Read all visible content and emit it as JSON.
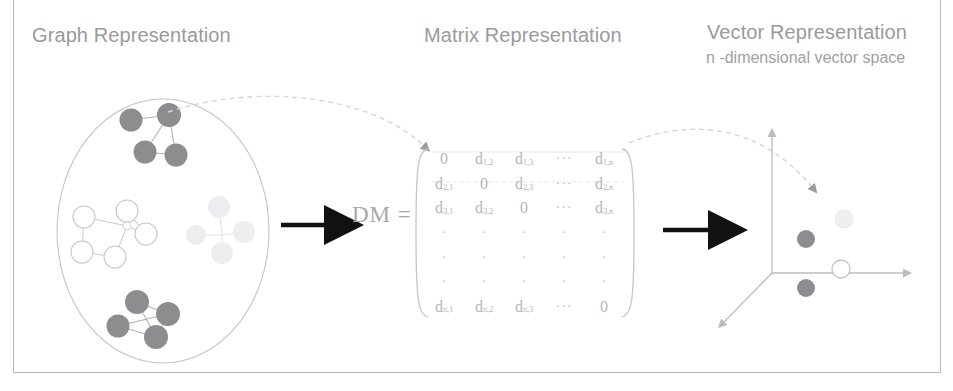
{
  "figure": {
    "alt_title": "Graph to Matrix to Vector Representation pipeline",
    "background_color": "#ffffff",
    "frame_color": "#b9b9bb"
  },
  "panels": {
    "graph": {
      "title": "Graph Representation",
      "boundary_shape": "ellipse",
      "clusters": [
        {
          "name": "cluster-top-dark",
          "style": "dark-filled",
          "fill_color": "#8d8d8f",
          "node_count": 4,
          "edge_count": 4
        },
        {
          "name": "cluster-left-outline",
          "style": "white-outline",
          "fill_color": "#ffffff",
          "stroke_color": "#c8c8ca",
          "node_count": 6,
          "edge_count": 6
        },
        {
          "name": "cluster-right-faint",
          "style": "very-light",
          "fill_color": "#ededef",
          "node_count": 4,
          "edge_count": 3
        },
        {
          "name": "cluster-bottom-dark",
          "style": "dark-filled",
          "fill_color": "#8d8d8f",
          "node_count": 4,
          "edge_count": 5
        }
      ]
    },
    "matrix": {
      "title": "Matrix Representation",
      "equation_label": "DM =",
      "bracket_style": "round-parentheses",
      "rows": [
        [
          "0",
          "d|1,2",
          "d|1,3",
          "...",
          "d|1,n"
        ],
        [
          "d|2,1",
          "0",
          "d|2,3",
          "...",
          "d|2,n"
        ],
        [
          "d|3,1",
          "d|3,2",
          "0",
          "...",
          "d|3,n"
        ],
        [
          ".",
          ".",
          ".",
          ".",
          "."
        ],
        [
          ".",
          ".",
          ".",
          ".",
          "."
        ],
        [
          ".",
          ".",
          ".",
          ".",
          "."
        ],
        [
          "d|n,1",
          "d|n,2",
          "d|n,3",
          "...",
          "0"
        ]
      ]
    },
    "vector": {
      "title": "Vector Representation",
      "subtitle": "n -dimensional vector space",
      "axes": [
        "y-axis-vertical",
        "x-axis-horizontal",
        "z-axis-depth"
      ],
      "points": [
        {
          "name": "point-dark-upper",
          "style": "dark-filled",
          "color": "#8d8d8f"
        },
        {
          "name": "point-dark-lower",
          "style": "dark-filled",
          "color": "#8d8d8f"
        },
        {
          "name": "point-outline",
          "style": "white-outline",
          "color": "#ffffff"
        },
        {
          "name": "point-faint",
          "style": "very-light",
          "color": "#efefef"
        }
      ]
    }
  },
  "connectors": {
    "arrow_graph_to_matrix": {
      "name": "black-arrow-1",
      "style": "solid-black"
    },
    "arrow_matrix_to_vector": {
      "name": "black-arrow-2",
      "style": "solid-black"
    },
    "dashed_graph_to_matrix": {
      "name": "dashed-curve-1",
      "style": "dashed-gray"
    },
    "dashed_matrix_to_vector": {
      "name": "dashed-curve-2",
      "style": "dashed-gray"
    }
  },
  "colors": {
    "node_dark": "#8d8d8f",
    "node_outline": "#c8c8ca",
    "node_faint": "#ededef",
    "text_gray": "#9a9a9c",
    "matrix_gray": "#b4b4b6",
    "arrow_black": "#111111",
    "dashed_gray": "#d5d5d7",
    "ellipse_stroke": "#c4c4c6"
  }
}
